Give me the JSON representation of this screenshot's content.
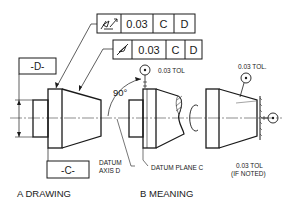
{
  "frame_runout_total": {
    "symbol": "total-runout-icon",
    "tolerance": "0.03",
    "datum1": "C",
    "datum2": "D"
  },
  "frame_runout_circular": {
    "symbol": "circular-runout-icon",
    "tolerance": "0.03",
    "datum1": "C",
    "datum2": "D"
  },
  "datum_d_label": "-D-",
  "datum_c_label": "-C-",
  "angle_label": "90°",
  "datum_axis_label_1": "DATUM",
  "datum_axis_label_2": "AXIS D",
  "datum_plane_label": "DATUM PLANE C",
  "tol_label_face": "0.03 TOL",
  "tol_label_cone": "0.03 TOL.",
  "tol_label_end_1": "0.03 TOL",
  "tol_label_end_2": "(IF NOTED)",
  "caption_a": "A DRAWING",
  "caption_b": "B MEANING"
}
